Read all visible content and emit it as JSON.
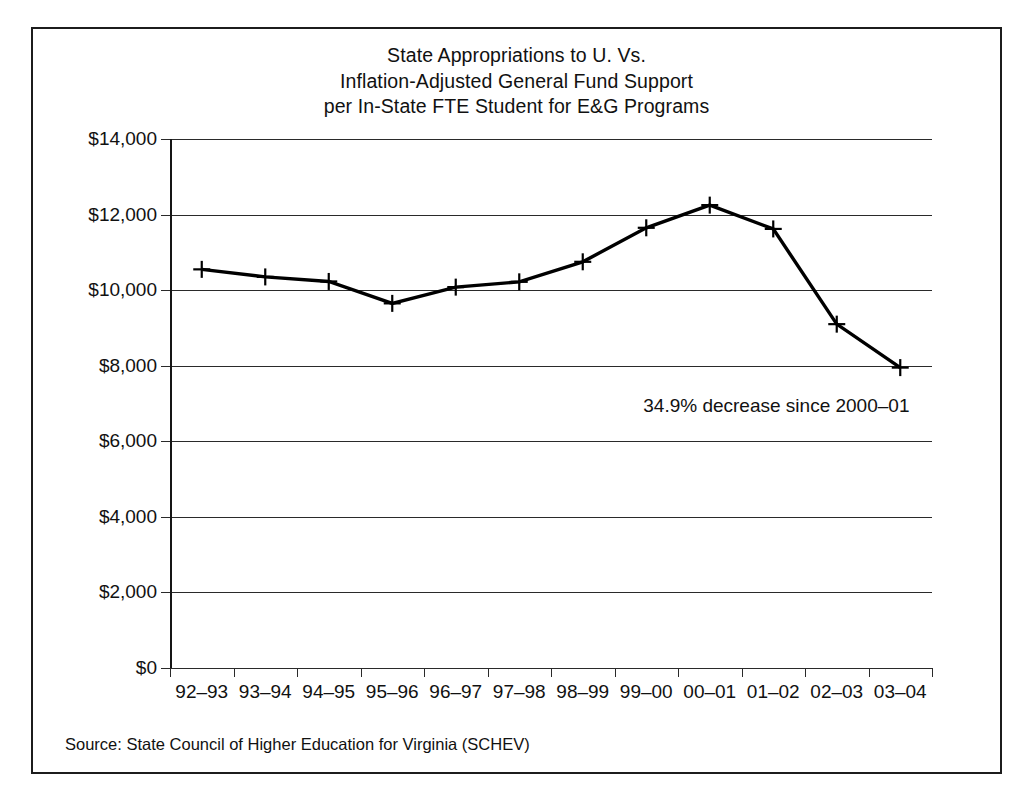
{
  "figure": {
    "source_note": "Source: State Council of Higher Education for Virginia (SCHEV)",
    "frame_color": "#1c1c1c",
    "line_color": "#000000",
    "background": "#ffffff"
  },
  "chart_data": {
    "type": "line",
    "title": "State Appropriations to U. Vs. Inflation-Adjusted General Fund Support per In-State FTE Student for E&G Programs",
    "title_lines": [
      "State Appropriations to U. Vs.",
      "Inflation-Adjusted General Fund Support",
      "per In-State FTE Student for E&G Programs"
    ],
    "xlabel": "",
    "ylabel": "",
    "categories": [
      "92–93",
      "93–94",
      "94–95",
      "95–96",
      "96–97",
      "97–98",
      "98–99",
      "99–00",
      "00–01",
      "01–02",
      "02–03",
      "03–04"
    ],
    "values": [
      10550,
      10350,
      10230,
      9650,
      10080,
      10220,
      10750,
      11650,
      12250,
      11620,
      9100,
      7950
    ],
    "ylim": [
      0,
      14000
    ],
    "ytick_values": [
      0,
      2000,
      4000,
      6000,
      8000,
      10000,
      12000,
      14000
    ],
    "ytick_labels": [
      "$0",
      "$2,000",
      "$4,000",
      "$6,000",
      "$8,000",
      "$10,000",
      "$12,000",
      "$14,000"
    ],
    "grid": true,
    "legend": false,
    "marker": "plus",
    "annotations": [
      {
        "text": "34.9% decrease since 2000–01",
        "x_category": "01–02",
        "y_value": 6900
      }
    ]
  }
}
